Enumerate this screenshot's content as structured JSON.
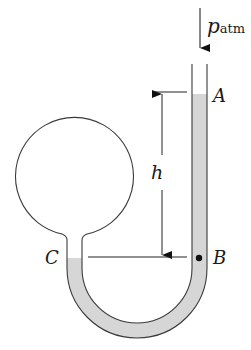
{
  "diagram": {
    "type": "manometer",
    "labels": {
      "pressure_symbol": "p",
      "pressure_subscript": "atm",
      "point_a": "A",
      "point_b": "B",
      "point_c": "C",
      "height": "h"
    },
    "colors": {
      "stroke": "#3a3a3a",
      "liquid": "#d6d6d6",
      "background": "#ffffff",
      "point_marker": "#111111"
    }
  }
}
